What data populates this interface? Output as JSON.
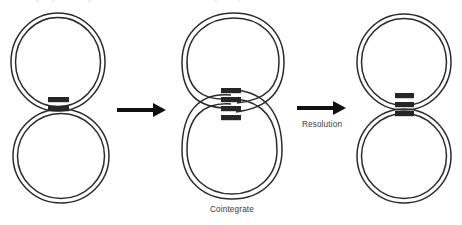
{
  "figure": {
    "title_fragment": "",
    "background": "#ffffff",
    "stroke_color": "#2b2b2b",
    "block_color": "#262626",
    "arrow_color": "#111111",
    "label_color": "#3a3a3a"
  },
  "stages": [
    {
      "id": "donor-and-target",
      "name": "separate-plasmids",
      "caption": "",
      "rings": [
        {
          "name": "upper-plasmid-ring",
          "cx": 58,
          "cy": 62,
          "rx": 47,
          "ry": 49
        },
        {
          "name": "lower-plasmid-ring",
          "cx": 61,
          "cy": 156,
          "rx": 48,
          "ry": 47
        }
      ],
      "blocks": [
        {
          "name": "transposon-block-upper",
          "x": 48,
          "y": 97,
          "w": 21,
          "h": 5
        },
        {
          "name": "transposon-block-lower",
          "x": 48,
          "y": 106,
          "w": 21,
          "h": 5
        }
      ],
      "block_count": 2
    },
    {
      "id": "cointegrate",
      "name": "cointegrate-figure-eight",
      "caption": "Cointegrate",
      "rings": [
        {
          "name": "cointegrate-upper-loop",
          "cx": 234,
          "cy": 60,
          "rx": 49,
          "ry": 47
        },
        {
          "name": "cointegrate-lower-loop",
          "cx": 232,
          "cy": 152,
          "rx": 50,
          "ry": 47
        }
      ],
      "blocks": [
        {
          "name": "crossover-block-1",
          "x": 221,
          "y": 88,
          "w": 20,
          "h": 5
        },
        {
          "name": "crossover-block-2",
          "x": 221,
          "y": 97,
          "w": 20,
          "h": 5
        },
        {
          "name": "crossover-block-3",
          "x": 221,
          "y": 106,
          "w": 20,
          "h": 5
        },
        {
          "name": "crossover-block-4",
          "x": 221,
          "y": 115,
          "w": 20,
          "h": 5
        }
      ],
      "block_count": 4
    },
    {
      "id": "resolved",
      "name": "resolved-plasmids",
      "caption": "",
      "rings": [
        {
          "name": "resolved-upper-ring",
          "cx": 404,
          "cy": 62,
          "rx": 47,
          "ry": 48
        },
        {
          "name": "resolved-lower-ring",
          "cx": 404,
          "cy": 156,
          "rx": 47,
          "ry": 47
        }
      ],
      "blocks": [
        {
          "name": "resolved-block-1",
          "x": 395,
          "y": 93,
          "w": 19,
          "h": 5
        },
        {
          "name": "resolved-block-2",
          "x": 395,
          "y": 102,
          "w": 19,
          "h": 5
        },
        {
          "name": "resolved-block-3",
          "x": 395,
          "y": 111,
          "w": 19,
          "h": 5
        }
      ],
      "block_count": 3
    }
  ],
  "arrows": [
    {
      "id": "arrow-1",
      "name": "arrow-to-cointegrate",
      "label": "",
      "x1": 117,
      "x2": 163,
      "y": 110
    },
    {
      "id": "arrow-2",
      "name": "arrow-to-resolution",
      "label": "Resolution",
      "x1": 297,
      "x2": 343,
      "y": 108
    }
  ],
  "labels": {
    "cointegrate": "Cointegrate",
    "resolution": "Resolution"
  }
}
